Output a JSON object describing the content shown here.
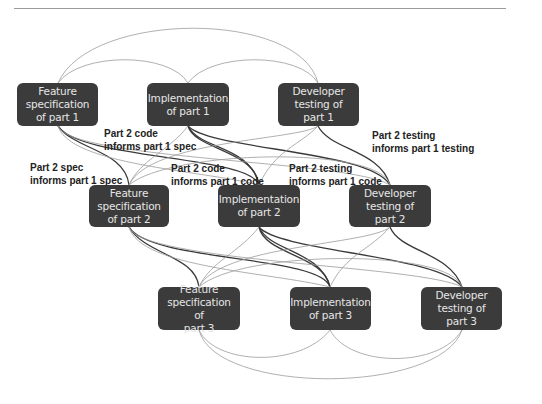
{
  "diagram": {
    "nodes": [
      {
        "id": "fs1",
        "label": "Feature specification of part 1",
        "lines": [
          "Feature",
          "specification",
          "of part 1"
        ]
      },
      {
        "id": "impl1",
        "label": "Implementation of part 1",
        "lines": [
          "Implementation",
          "of part 1"
        ]
      },
      {
        "id": "dev1",
        "label": "Developer testing of part 1",
        "lines": [
          "Developer",
          "testing of part 1"
        ]
      },
      {
        "id": "fs2",
        "label": "Feature specification of part 2",
        "lines": [
          "Feature",
          "specification",
          "of part 2"
        ]
      },
      {
        "id": "impl2",
        "label": "Implementation of part 2",
        "lines": [
          "Implementation",
          "of part 2"
        ]
      },
      {
        "id": "dev2",
        "label": "Developer testing of part 2",
        "lines": [
          "Developer",
          "testing of part 2"
        ]
      },
      {
        "id": "fs3",
        "label": "Feature specification of part 3",
        "lines": [
          "Feature",
          "specification of",
          "part 3"
        ]
      },
      {
        "id": "impl3",
        "label": "Implementation of part 3",
        "lines": [
          "Implementation",
          "of part 3"
        ]
      },
      {
        "id": "dev3",
        "label": "Developer testing of part 3",
        "lines": [
          "Developer",
          "testing of part 3"
        ]
      }
    ],
    "edge_labels": [
      {
        "id": "p2code-p1spec",
        "lines": [
          "Part 2 code",
          "informs part 1 spec"
        ]
      },
      {
        "id": "p2spec-p1spec",
        "lines": [
          "Part 2 spec",
          "informs part 1 spec"
        ]
      },
      {
        "id": "p2code-p1code",
        "lines": [
          "Part 2 code",
          "informs part 1 code"
        ]
      },
      {
        "id": "p2test-p1code",
        "lines": [
          "Part 2 testing",
          "informs part 1 code"
        ]
      },
      {
        "id": "p2test-p1test",
        "lines": [
          "Part 2 testing",
          "informs part 1 testing"
        ]
      }
    ],
    "colors": {
      "node_fill": "#3b3b3b",
      "node_text": "#e6e6e6",
      "edge_dark": "#3a3a3a",
      "edge_light": "#9c9c9c",
      "label_text": "#222222"
    }
  }
}
